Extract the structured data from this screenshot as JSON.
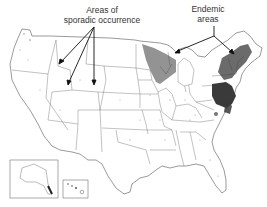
{
  "map": {
    "title": "",
    "region": "United States",
    "labels": {
      "sporadic": {
        "line1": "Areas of",
        "line2": "sporadic occurrence"
      },
      "endemic": {
        "line1": "Endemic",
        "line2": "areas"
      }
    },
    "insets": [
      "Alaska",
      "Hawaii"
    ],
    "colors": {
      "state_border": "#555555",
      "endemic_fill": "#3a3a3a",
      "sporadic_dots": "#888888",
      "arrow": "#111111",
      "background": "#ffffff"
    }
  }
}
